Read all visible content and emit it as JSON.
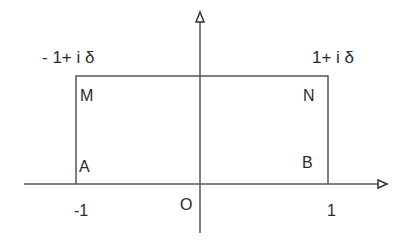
{
  "diagram": {
    "corner_labels": {
      "top_left_value": "- 1+ i δ",
      "top_right_value": "1+ i δ"
    },
    "vertices": {
      "M": "M",
      "N": "N",
      "A": "A",
      "B": "B"
    },
    "axis_ticks": {
      "left": "-1",
      "origin": "O",
      "right": "1"
    },
    "colors": {
      "line": "#555555",
      "text": "#2a2a2a"
    }
  }
}
